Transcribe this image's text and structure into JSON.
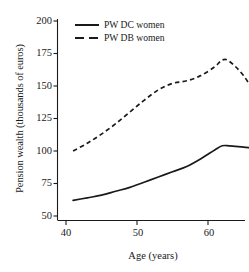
{
  "chart_data": {
    "type": "line",
    "title": "",
    "xlabel": "Age (years)",
    "ylabel": "Pension wealth (thousands of euros)",
    "xlim": [
      40,
      69
    ],
    "ylim": [
      50,
      200
    ],
    "xticks": [
      40,
      50,
      60
    ],
    "yticks": [
      50,
      75,
      100,
      125,
      150,
      175,
      200
    ],
    "grid": false,
    "legend_position": "top-center",
    "x": [
      41,
      43,
      45,
      47,
      49,
      51,
      53,
      55,
      57,
      59,
      61,
      62,
      63,
      65,
      67,
      68
    ],
    "series": [
      {
        "name": "PW DC women",
        "style": "solid",
        "color": "#1a1a1a",
        "values": [
          62,
          64,
          66,
          69,
          72,
          76,
          80,
          84,
          88,
          94,
          101,
          104,
          104,
          103,
          102,
          102
        ]
      },
      {
        "name": "PW DB women",
        "style": "dashed",
        "color": "#1a1a1a",
        "values": [
          100,
          106,
          113,
          121,
          130,
          139,
          147,
          152,
          154,
          158,
          165,
          170,
          169,
          158,
          140,
          124
        ]
      }
    ]
  },
  "axis": {
    "y_tick_labels": [
      "200",
      "175",
      "150",
      "125",
      "100",
      "75",
      "50"
    ],
    "x_tick_labels": [
      "40",
      "50",
      "60"
    ],
    "y_title": "Pension wealth (thousands of euros)",
    "x_title": "Age (years)"
  },
  "legend": {
    "items": [
      {
        "label": "PW DC women",
        "key": "solid-line-key"
      },
      {
        "label": "PW DB women",
        "key": "dashed-line-key"
      }
    ]
  }
}
